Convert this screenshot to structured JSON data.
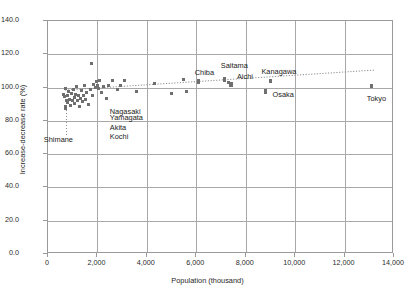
{
  "chart_data": {
    "type": "scatter",
    "title": "",
    "xlabel": "Population (thousand)",
    "ylabel": "Increase-decrease rate (%)",
    "xlim": [
      0,
      14000
    ],
    "ylim": [
      0,
      140
    ],
    "xticks": [
      "0",
      "2,000",
      "4,000",
      "6,000",
      "8,000",
      "10,000",
      "12,000",
      "14,000"
    ],
    "xtick_values": [
      0,
      2000,
      4000,
      6000,
      8000,
      10000,
      12000,
      14000
    ],
    "yticks": [
      "0.0",
      "20.0",
      "40.0",
      "60.0",
      "80.0",
      "100.0",
      "120.0",
      "140.0"
    ],
    "ytick_values": [
      0,
      20,
      40,
      60,
      80,
      100,
      120,
      140
    ],
    "grid": true,
    "legend": "none",
    "marker_color": "#6f6f6f",
    "grid_color": "#a8a8a8",
    "trendline": {
      "style": "dotted",
      "color": "#8d8d8d",
      "x_start": 700,
      "y_start": 98.5,
      "x_end": 13200,
      "y_end": 110.5
    },
    "points": [
      {
        "label": "",
        "x": 620,
        "y": 96.0
      },
      {
        "label": "",
        "x": 680,
        "y": 94.5
      },
      {
        "label": "",
        "x": 700,
        "y": 99.5
      },
      {
        "label": "",
        "x": 740,
        "y": 92.0
      },
      {
        "label": "",
        "x": 780,
        "y": 95.5
      },
      {
        "label": "",
        "x": 800,
        "y": 91.0
      },
      {
        "label": "",
        "x": 840,
        "y": 97.5
      },
      {
        "label": "",
        "x": 880,
        "y": 93.0
      },
      {
        "label": "",
        "x": 930,
        "y": 89.5
      },
      {
        "label": "",
        "x": 960,
        "y": 96.5
      },
      {
        "label": "",
        "x": 1000,
        "y": 92.5
      },
      {
        "label": "",
        "x": 1030,
        "y": 99.0
      },
      {
        "label": "",
        "x": 1060,
        "y": 94.0
      },
      {
        "label": "",
        "x": 1090,
        "y": 90.5
      },
      {
        "label": "",
        "x": 1130,
        "y": 96.0
      },
      {
        "label": "",
        "x": 1150,
        "y": 100.5
      },
      {
        "label": "",
        "x": 1180,
        "y": 92.0
      },
      {
        "label": "",
        "x": 1220,
        "y": 95.0
      },
      {
        "label": "",
        "x": 1260,
        "y": 88.5
      },
      {
        "label": "",
        "x": 1300,
        "y": 93.5
      },
      {
        "label": "",
        "x": 1350,
        "y": 98.0
      },
      {
        "label": "",
        "x": 1400,
        "y": 91.5
      },
      {
        "label": "",
        "x": 1420,
        "y": 95.5
      },
      {
        "label": "",
        "x": 1460,
        "y": 101.0
      },
      {
        "label": "",
        "x": 1500,
        "y": 93.0
      },
      {
        "label": "",
        "x": 1560,
        "y": 97.0
      },
      {
        "label": "",
        "x": 1620,
        "y": 90.0
      },
      {
        "label": "",
        "x": 1700,
        "y": 99.0
      },
      {
        "label": "",
        "x": 1760,
        "y": 114.5
      },
      {
        "label": "",
        "x": 1800,
        "y": 95.0
      },
      {
        "label": "",
        "x": 1860,
        "y": 102.0
      },
      {
        "label": "",
        "x": 1930,
        "y": 100.0
      },
      {
        "label": "",
        "x": 1980,
        "y": 103.5
      },
      {
        "label": "",
        "x": 2020,
        "y": 101.5
      },
      {
        "label": "",
        "x": 2060,
        "y": 99.5
      },
      {
        "label": "",
        "x": 2100,
        "y": 104.0
      },
      {
        "label": "",
        "x": 2150,
        "y": 97.0
      },
      {
        "label": "",
        "x": 2250,
        "y": 100.5
      },
      {
        "label": "",
        "x": 2350,
        "y": 93.5
      },
      {
        "label": "",
        "x": 2450,
        "y": 101.0
      },
      {
        "label": "",
        "x": 2600,
        "y": 104.5
      },
      {
        "label": "",
        "x": 2800,
        "y": 99.0
      },
      {
        "label": "",
        "x": 2950,
        "y": 101.0
      },
      {
        "label": "",
        "x": 3100,
        "y": 104.0
      },
      {
        "label": "",
        "x": 3600,
        "y": 97.5
      },
      {
        "label": "",
        "x": 4300,
        "y": 102.5
      },
      {
        "label": "",
        "x": 5000,
        "y": 96.5
      },
      {
        "label": "",
        "x": 5500,
        "y": 105.0
      },
      {
        "label": "",
        "x": 5600,
        "y": 97.5
      },
      {
        "label": "Chiba",
        "x": 6100,
        "y": 103.5,
        "lx": -4,
        "ly": -13
      },
      {
        "label": "Saitama",
        "x": 7150,
        "y": 105.0,
        "lx": -4,
        "ly": -17
      },
      {
        "label": "",
        "x": 7300,
        "y": 103.0
      },
      {
        "label": "Aichi",
        "x": 7400,
        "y": 102.0,
        "lx": 6,
        "ly": -11
      },
      {
        "label": "Kanagawa",
        "x": 9000,
        "y": 104.0,
        "lx": -9,
        "ly": -13
      },
      {
        "label": "Osaka",
        "x": 8800,
        "y": 97.5,
        "lx": 7,
        "ly": -1
      },
      {
        "label": "Tokyo",
        "x": 13100,
        "y": 101.0,
        "lx": -5,
        "ly": 9
      },
      {
        "label": "Shimane",
        "x": 720,
        "y": 88.0,
        "lx": -22,
        "ly": 28,
        "leader": true
      }
    ],
    "annotations": [
      {
        "text": "Nagasaki",
        "x": 2500,
        "y": 85.5
      },
      {
        "text": "Yamagata",
        "x": 2500,
        "y": 81.5
      },
      {
        "text": "Akita",
        "x": 2500,
        "y": 76.0
      },
      {
        "text": "Kochi",
        "x": 2500,
        "y": 70.5
      }
    ]
  }
}
